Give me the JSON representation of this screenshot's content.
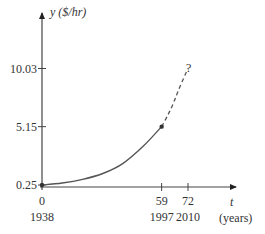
{
  "chart_data": {
    "type": "line",
    "title": "",
    "xlabel": "t",
    "xlabel_units": "(years)",
    "ylabel": "y ($/hr)",
    "x_ticks": [
      {
        "value": 0,
        "label": "0",
        "year": "1938"
      },
      {
        "value": 59,
        "label": "59",
        "year": "1997"
      },
      {
        "value": 72,
        "label": "72",
        "year": "2010"
      }
    ],
    "y_ticks": [
      {
        "value": 0.25,
        "label": "0.25"
      },
      {
        "value": 5.15,
        "label": "5.15"
      },
      {
        "value": 10.03,
        "label": "10.03"
      }
    ],
    "series": [
      {
        "name": "observed",
        "style": "solid",
        "x": [
          0,
          10,
          20,
          30,
          40,
          50,
          59
        ],
        "y": [
          0.25,
          0.42,
          0.72,
          1.22,
          2.07,
          3.52,
          5.15
        ]
      },
      {
        "name": "projected",
        "style": "dashed",
        "x": [
          59,
          62,
          65,
          68,
          72
        ],
        "y": [
          5.15,
          6.1,
          7.2,
          8.5,
          10.03
        ]
      }
    ],
    "points": [
      {
        "x": 0,
        "y": 0.25,
        "marker": "dot"
      },
      {
        "x": 59,
        "y": 5.15,
        "marker": "dot"
      }
    ],
    "annotations": [
      {
        "x": 72,
        "y": 10.03,
        "text": "?"
      }
    ],
    "xlim": [
      0,
      100
    ],
    "ylim": [
      0,
      12
    ],
    "grid": false,
    "legend": "none"
  },
  "labels": {
    "y_axis": "y ($/hr)",
    "x_axis": "t",
    "x_units": "(years)",
    "question": "?"
  },
  "colors": {
    "axis": "#333333",
    "curve": "#555555"
  }
}
